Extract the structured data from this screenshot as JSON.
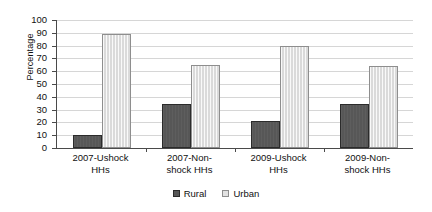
{
  "chart_data": {
    "type": "bar",
    "title": "",
    "subtitle": "",
    "xlabel": "",
    "ylabel": "Percentage",
    "ylim": [
      0,
      100
    ],
    "ytick_step": 10,
    "yticks": [
      0,
      10,
      20,
      30,
      40,
      50,
      60,
      70,
      80,
      90,
      100
    ],
    "grid": true,
    "grid_axis": "y",
    "legend_position": "bottom-center",
    "categories": [
      "2007-Ushock HHs",
      "2007-Non-shock HHs",
      "2009-Ushock HHs",
      "2009-Non-shock HHs"
    ],
    "category_lines": [
      [
        "2007-Ushock",
        "HHs"
      ],
      [
        "2007-Non-",
        "shock HHs"
      ],
      [
        "2009-Ushock",
        "HHs"
      ],
      [
        "2009-Non-",
        "shock HHs"
      ]
    ],
    "series": [
      {
        "name": "Rural",
        "color": "#575757",
        "values": [
          10,
          34,
          21,
          34
        ]
      },
      {
        "name": "Urban",
        "color": "#dadada",
        "values": [
          89,
          65,
          80,
          64
        ]
      }
    ]
  },
  "axis": {
    "y_title": "Percentage",
    "y_tick_labels": [
      "100",
      "90",
      "80",
      "70",
      "60",
      "50",
      "40",
      "30",
      "20",
      "10",
      "0"
    ]
  },
  "legend": {
    "items": [
      {
        "label": "Rural",
        "swatch": "rural-swatch-icon"
      },
      {
        "label": "Urban",
        "swatch": "urban-swatch-icon"
      }
    ]
  }
}
